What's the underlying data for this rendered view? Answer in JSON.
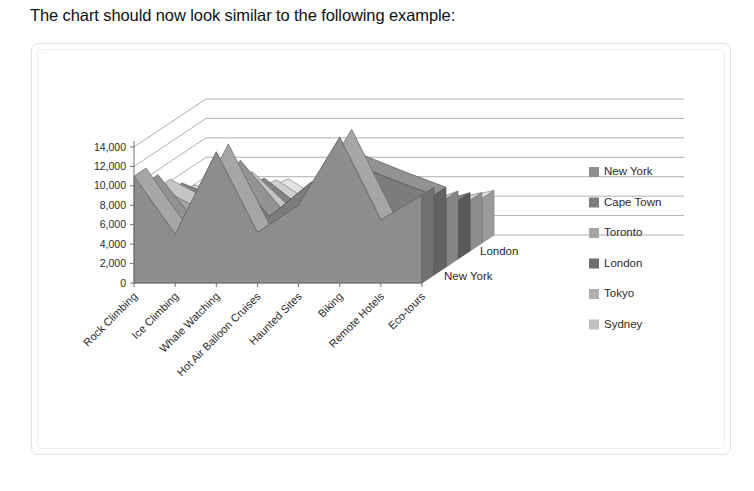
{
  "intro": {
    "text": "The chart should now look similar to the following example:"
  },
  "chart_frame": {
    "name": "chart-picture-frame"
  },
  "legend": {
    "position": "right",
    "items": [
      {
        "label": "New York",
        "color": "#8d8d8d"
      },
      {
        "label": "Cape Town",
        "color": "#7c7c7c"
      },
      {
        "label": "Toronto",
        "color": "#a6a6a6"
      },
      {
        "label": "London",
        "color": "#6f6f6f"
      },
      {
        "label": "Tokyo",
        "color": "#b0b0b0"
      },
      {
        "label": "Sydney",
        "color": "#c0c0c0"
      }
    ]
  },
  "depth_axis": {
    "visible_labels": [
      "London",
      "New York"
    ]
  },
  "chart_data": {
    "type": "area",
    "subtype": "3-D area chart",
    "title": "",
    "xlabel": "",
    "ylabel": "",
    "ylim": [
      0,
      14000
    ],
    "ytick_labels": [
      "14,000",
      "12,000",
      "10,000",
      "8,000",
      "6,000",
      "4,000",
      "2,000",
      "0"
    ],
    "ytick_values": [
      14000,
      12000,
      10000,
      8000,
      6000,
      4000,
      2000,
      0
    ],
    "grid": true,
    "legend_position": "right",
    "categories": [
      "Rock Climbing",
      "Ice Climbing",
      "Whale Watching",
      "Hot Air Balloon Cruises",
      "Haunted Sites",
      "Biking",
      "Remote Hotels",
      "Eco-tours"
    ],
    "series": [
      {
        "name": "New York",
        "values": [
          11000,
          5000,
          13500,
          5200,
          8000,
          15000,
          6500,
          9000
        ]
      },
      {
        "name": "Cape Town",
        "values": [
          9500,
          4200,
          11000,
          6000,
          9500,
          11500,
          9800,
          8200
        ]
      },
      {
        "name": "Toronto",
        "values": [
          8200,
          6000,
          9000,
          5000,
          7000,
          9500,
          5500,
          7000
        ]
      },
      {
        "name": "London",
        "values": [
          7000,
          5200,
          7500,
          4200,
          6200,
          8000,
          4800,
          6000
        ]
      },
      {
        "name": "Tokyo",
        "values": [
          6000,
          4500,
          6500,
          3800,
          5500,
          7000,
          4200,
          5200
        ]
      },
      {
        "name": "Sydney",
        "values": [
          5200,
          3800,
          5800,
          3200,
          4800,
          6200,
          3600,
          4600
        ]
      }
    ]
  }
}
